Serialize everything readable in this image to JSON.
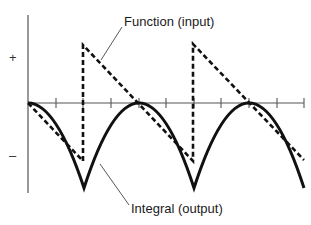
{
  "diagram": {
    "type": "signal-integration",
    "labels": {
      "function": "Function (input)",
      "integral": "Integral (output)",
      "plus": "+",
      "minus": "–"
    },
    "colors": {
      "axis": "#555555",
      "curve": "#111111",
      "leader": "#444444",
      "text": "#1a1a1a"
    },
    "axes": {
      "origin": [
        28,
        103
      ],
      "y_top": 15,
      "y_bottom": 193,
      "x_right": 304,
      "x_ticks": [
        56,
        83,
        111,
        139,
        166,
        194,
        221,
        249,
        277,
        304
      ]
    },
    "function_input": {
      "style": "dashed",
      "shape": "sawtooth",
      "points": [
        [
          28,
          103
        ],
        [
          83,
          161
        ],
        [
          83,
          45
        ],
        [
          193,
          161
        ],
        [
          193,
          44
        ],
        [
          304,
          160
        ]
      ]
    },
    "integral_output": {
      "style": "solid",
      "shape": "parabolic-arcs",
      "segments": [
        {
          "from": [
            28,
            103
          ],
          "ctrl": [
            56,
            103
          ],
          "to": [
            84,
            188
          ]
        },
        {
          "from": [
            84,
            188
          ],
          "ctrl": [
            139,
            18
          ],
          "to": [
            194,
            188
          ]
        },
        {
          "from": [
            194,
            188
          ],
          "ctrl": [
            249,
            18
          ],
          "to": [
            304,
            188
          ]
        }
      ],
      "peaks": [
        [
          28,
          103
        ],
        [
          139,
          103
        ],
        [
          249,
          103
        ]
      ],
      "troughs": [
        [
          84,
          188
        ],
        [
          194,
          188
        ]
      ]
    },
    "leaders": {
      "function": {
        "from": [
          122,
          27
        ],
        "to": [
          101,
          60
        ]
      },
      "integral": {
        "from": [
          100,
          164
        ],
        "to": [
          129,
          205
        ]
      }
    }
  }
}
